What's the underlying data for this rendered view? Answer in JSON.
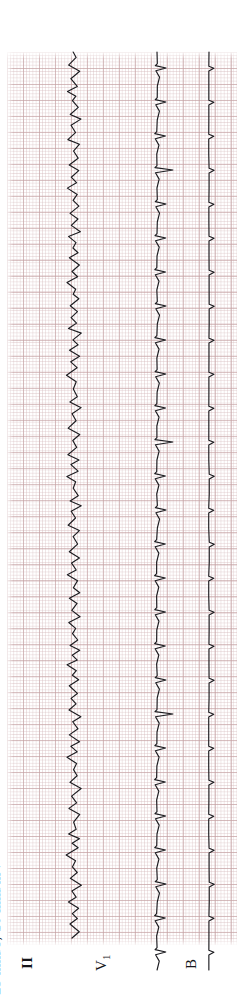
{
  "document": {
    "type": "ecg-rhythm-strip",
    "orientation": "rotated-90-ccw",
    "paper_color": "#ffffff",
    "grid_color": "#d6bcbe",
    "grid_bold_color": "#c4a0a2",
    "trace_color": "#1c1c20"
  },
  "annotations": {
    "calibration": "25 mm/s;  10 mm/mV"
  },
  "leads": [
    {
      "id": "II",
      "label": "II"
    },
    {
      "id": "V1",
      "label": "V",
      "subscript": "1"
    },
    {
      "id": "B",
      "label": "B"
    }
  ],
  "chart_data": {
    "type": "line",
    "title": "",
    "xlabel": "",
    "ylabel": "",
    "paper_speed_mm_per_s": 25,
    "gain_mm_per_mV": 10,
    "grid": true,
    "small_square_px": 3.2,
    "large_square_px": 16,
    "legend_position": "bottom",
    "series": [
      {
        "name": "II",
        "description": "Rapid irregular sawtooth rhythm, continuous undulating baseline with narrow deflections",
        "rhythm": "atrial-flutter-fibrillation",
        "amplitude_mm": 4,
        "cycle_px": 17,
        "points_px": [
          0,
          2,
          -3,
          4,
          -1,
          3,
          -4,
          2,
          0,
          3,
          -2,
          5,
          -1,
          2,
          -3,
          4,
          0,
          3,
          -2,
          4,
          -1,
          2,
          -4,
          3,
          0,
          4,
          -2,
          3,
          -1,
          5,
          -3,
          2,
          0,
          3,
          -2,
          4,
          -1,
          3,
          -4,
          2,
          0,
          4,
          -2,
          3,
          -1,
          2,
          -3,
          5,
          0,
          3,
          -2,
          4,
          -1,
          3,
          -4,
          2,
          0,
          3,
          -2,
          5,
          -1,
          2,
          -3,
          4
        ]
      },
      {
        "name": "V1",
        "description": "Regular narrow QRS complexes with intermittent wide tall beats",
        "rhythm": "regular-with-ectopic-beats",
        "qrs_amplitude_mm": 6,
        "tall_beat_amplitude_mm": 11,
        "cycle_px": 34,
        "beats": 26,
        "tall_beat_indices": [
          3,
          11,
          19
        ]
      },
      {
        "name": "B",
        "description": "Partial third channel visible at right margin",
        "visible_fraction": 0.15
      }
    ]
  }
}
